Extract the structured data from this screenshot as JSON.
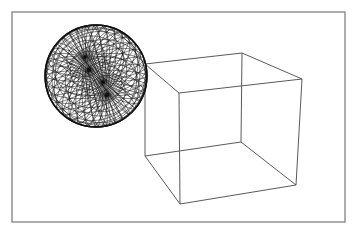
{
  "scene": {
    "background": "#ffffff",
    "frame": {
      "x": 12,
      "y": 12,
      "width": 333,
      "height": 210,
      "stroke": "#8a8a8a"
    },
    "cube": {
      "stroke": "#5a5a5a",
      "vertices": {
        "back_top_left": [
          145,
          64
        ],
        "back_top_right": [
          242,
          53
        ],
        "front_top_left": [
          179,
          93
        ],
        "front_top_right": [
          302,
          79
        ],
        "back_bottom_left": [
          145,
          156
        ],
        "back_bottom_right": [
          241,
          142
        ],
        "front_bottom_left": [
          180,
          204
        ],
        "front_bottom_right": [
          296,
          185
        ]
      },
      "edges": [
        [
          "back_top_left",
          "back_top_right"
        ],
        [
          "back_top_left",
          "front_top_left"
        ],
        [
          "back_top_right",
          "front_top_right"
        ],
        [
          "front_top_left",
          "front_top_right"
        ],
        [
          "back_bottom_left",
          "back_bottom_right"
        ],
        [
          "back_bottom_left",
          "front_bottom_left"
        ],
        [
          "back_bottom_right",
          "front_bottom_right"
        ],
        [
          "front_bottom_left",
          "front_bottom_right"
        ],
        [
          "back_top_left",
          "back_bottom_left"
        ],
        [
          "back_top_right",
          "back_bottom_right"
        ],
        [
          "front_top_left",
          "front_bottom_left"
        ],
        [
          "front_top_right",
          "front_bottom_right"
        ]
      ]
    },
    "sphere": {
      "center": [
        96,
        76
      ],
      "radius": 51,
      "stroke": "#111111",
      "poles": [
        [
          89,
          70
        ],
        [
          107,
          95
        ]
      ],
      "meridians_per_pole": 18,
      "parallels_per_pole": 7
    }
  }
}
